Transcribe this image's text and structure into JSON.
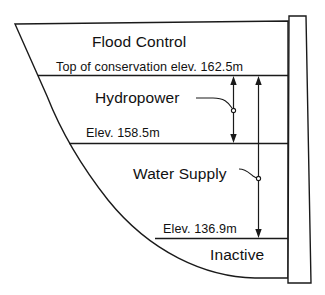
{
  "figure": {
    "kind": "reservoir-storage-zone-cross-section",
    "background_color": "#ffffff",
    "line_color": "#1a1a1a"
  },
  "zones": [
    {
      "id": "flood_control",
      "label": "Flood Control"
    },
    {
      "id": "hydropower",
      "label": "Hydropower"
    },
    {
      "id": "water_supply",
      "label": "Water Supply"
    },
    {
      "id": "inactive",
      "label": "Inactive"
    }
  ],
  "elevation_labels": [
    {
      "id": "top_of_conservation",
      "label": "Top of conservation elev. 162.5m",
      "value": 162.5,
      "unit": "m"
    },
    {
      "id": "elev_158",
      "label": "Elev. 158.5m",
      "value": 158.5,
      "unit": "m"
    },
    {
      "id": "elev_136",
      "label": "Elev. 136.9m",
      "value": 136.9,
      "unit": "m"
    }
  ],
  "dimension_arrows": [
    {
      "id": "hydropower-extent",
      "from_label": "Top of conservation elev. 162.5m",
      "to_label": "Elev. 158.5m",
      "points_to_zone": "Hydropower"
    },
    {
      "id": "water-supply-extent",
      "from_label": "Top of conservation elev. 162.5m",
      "to_label": "Elev. 136.9m",
      "points_to_zone": "Water Supply"
    }
  ],
  "parts": {
    "dam_wall": "dam-wall",
    "reservoir_basin": "reservoir-basin"
  }
}
